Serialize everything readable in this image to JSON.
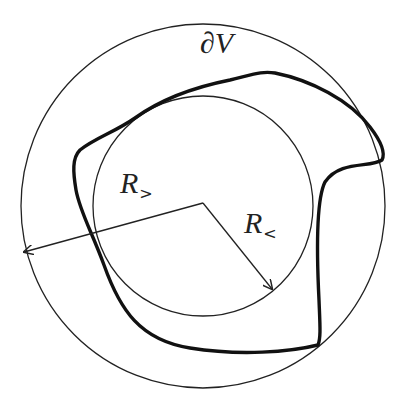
{
  "diagram": {
    "center": {
      "x": 203,
      "y": 206
    },
    "outer_circle": {
      "radius": 182,
      "label": "R",
      "label_subscript": ">"
    },
    "inner_circle": {
      "radius": 110,
      "label": "R",
      "label_subscript": "<"
    },
    "boundary": {
      "label": "∂V"
    },
    "colors": {
      "stroke": "#222222",
      "background": "#ffffff"
    }
  },
  "labels": {
    "boundary": "∂V",
    "outer_radius_main": "R",
    "outer_radius_sub": ">",
    "inner_radius_main": "R",
    "inner_radius_sub": "<"
  }
}
